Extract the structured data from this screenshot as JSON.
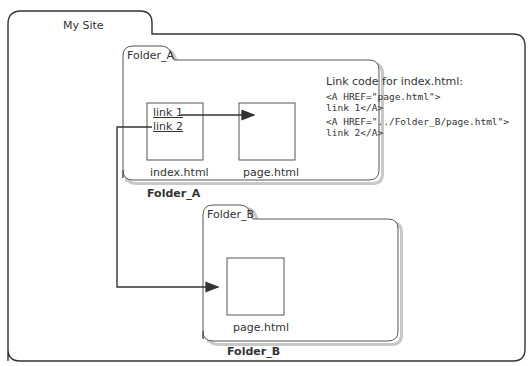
{
  "diagram": {
    "root": {
      "label": "My Site"
    },
    "folder_a": {
      "tab_label": "Folder_A",
      "caption": "Folder_A",
      "files": [
        {
          "name": "index.html",
          "links": [
            "link 1",
            "link 2"
          ]
        },
        {
          "name": "page.html"
        }
      ]
    },
    "folder_b": {
      "tab_label": "Folder_B",
      "caption": "Folder_B",
      "files": [
        {
          "name": "page.html"
        }
      ]
    },
    "code_note": {
      "title": "Link code for index.html:",
      "lines": [
        "<A HREF=\"page.html\">",
        "link 1</A>",
        "<A HREF=\"../Folder_B/page.html\">",
        "link 2</A>"
      ]
    },
    "arrows": [
      {
        "from": "index.html link 1",
        "to": "Folder_A/page.html"
      },
      {
        "from": "index.html link 2",
        "to": "Folder_B/page.html"
      }
    ],
    "colors": {
      "stroke": "#333333",
      "background": "#ffffff",
      "shadow": "#bbbbbb"
    }
  }
}
